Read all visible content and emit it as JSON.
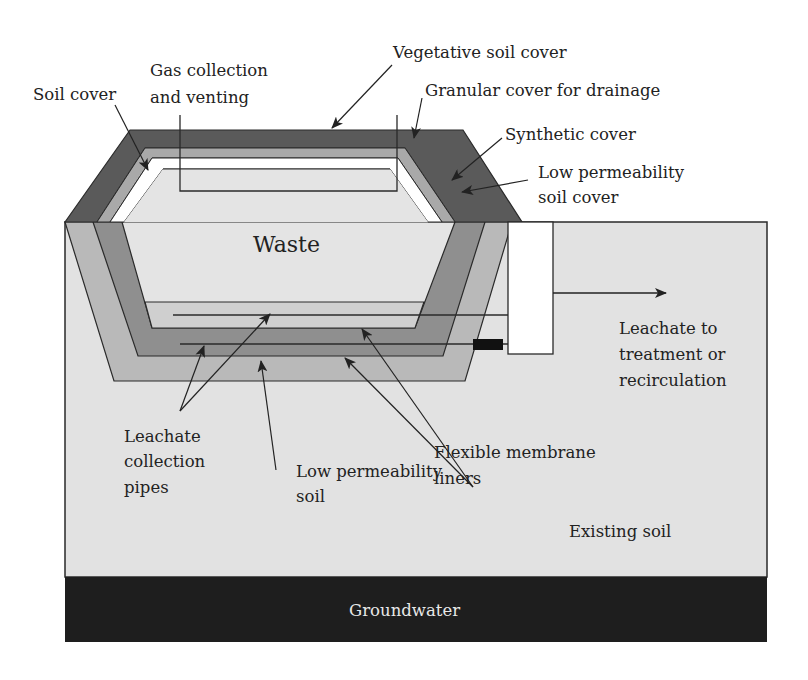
{
  "diagram": {
    "colors": {
      "background": "#ffffff",
      "existing_soil": "#e2e2e2",
      "groundwater": "#1e1e1e",
      "vegetative_cover": "#5a5a5a",
      "granular_cover": "#a9a9a9",
      "synthetic_cover": "#ffffff",
      "waste": "#e4e4e4",
      "liner_outer": "#b9b9b9",
      "liner_middle": "#8f8f8f",
      "gravel_layer": "#cfcfcf",
      "sump": "#ffffff",
      "valve": "#111111",
      "line": "#2a2a2a"
    },
    "labels": {
      "soil_cover": "Soil cover",
      "gas_collection_line1": "Gas collection",
      "gas_collection_line2": "and venting",
      "vegetative_soil_cover": "Vegetative soil cover",
      "granular_cover": "Granular cover for drainage",
      "synthetic_cover": "Synthetic cover",
      "low_perm_cover_line1": "Low permeability",
      "low_perm_cover_line2": "soil cover",
      "waste": "Waste",
      "leachate_out_line1": "Leachate to",
      "leachate_out_line2": "treatment or",
      "leachate_out_line3": "recirculation",
      "pipes_line1": "Leachate",
      "pipes_line2": "collection",
      "pipes_line3": "pipes",
      "low_perm_soil_line1": "Low permeability",
      "low_perm_soil_line2": "soil",
      "fml_line1": "Flexible membrane",
      "fml_line2": "liners",
      "existing_soil": "Existing soil",
      "groundwater": "Groundwater"
    }
  }
}
